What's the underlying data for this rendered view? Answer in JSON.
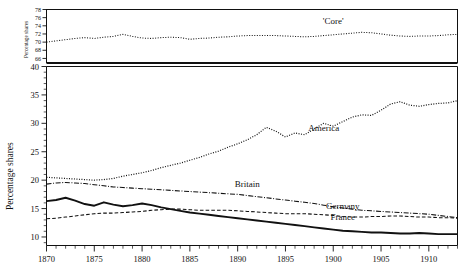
{
  "chart_data": {
    "type": "line",
    "title": "",
    "xlabel": "",
    "ylabel": "Percentage shares",
    "ylabel_top": "Percentage shares",
    "xlim": [
      1870,
      1913
    ],
    "ylim": [
      8.5,
      40
    ],
    "ylim_top": [
      65,
      78
    ],
    "grid": false,
    "legend": "inline-annotations",
    "yticks": [
      10,
      15,
      20,
      25,
      30,
      35,
      40
    ],
    "yticks_top": [
      66,
      68,
      70,
      72,
      74,
      76,
      78
    ],
    "xticks": [
      1870,
      1875,
      1880,
      1885,
      1890,
      1895,
      1900,
      1905,
      1910
    ],
    "xtick_labels": [
      "1870",
      "1875",
      "1880",
      "1885",
      "1890",
      "1895",
      "1900",
      "1905",
      "1910"
    ],
    "minor_xtick_step": 1,
    "x": [
      1870,
      1871,
      1872,
      1873,
      1874,
      1875,
      1876,
      1877,
      1878,
      1879,
      1880,
      1881,
      1882,
      1883,
      1884,
      1885,
      1886,
      1887,
      1888,
      1889,
      1890,
      1891,
      1892,
      1893,
      1894,
      1895,
      1896,
      1897,
      1898,
      1899,
      1900,
      1901,
      1902,
      1903,
      1904,
      1905,
      1906,
      1907,
      1908,
      1909,
      1910,
      1911,
      1912,
      1913
    ],
    "series": [
      {
        "name": "'Core'",
        "panel": "top",
        "style": "dotted",
        "label": "'Core'",
        "label_x": 1900,
        "label_y": 74.4,
        "values": [
          70.0,
          70.3,
          70.6,
          70.9,
          71.1,
          70.9,
          71.2,
          71.4,
          71.9,
          71.4,
          71.0,
          70.9,
          71.1,
          71.2,
          71.1,
          70.7,
          70.9,
          71.0,
          71.2,
          71.3,
          71.5,
          71.6,
          71.6,
          71.6,
          71.6,
          71.5,
          71.4,
          71.3,
          71.4,
          71.6,
          71.8,
          72.0,
          72.2,
          72.4,
          72.3,
          72.0,
          71.7,
          71.5,
          71.4,
          71.5,
          71.5,
          71.6,
          71.8,
          71.9
        ]
      },
      {
        "name": "America",
        "panel": "main",
        "style": "dotted",
        "label": "America",
        "label_x": 1899,
        "label_y": 28.7,
        "values": [
          20.5,
          20.4,
          20.3,
          20.2,
          20.1,
          20.0,
          20.1,
          20.3,
          20.7,
          21.0,
          21.3,
          21.7,
          22.2,
          22.6,
          23.0,
          23.5,
          24.0,
          24.6,
          25.1,
          25.8,
          26.4,
          27.1,
          28.0,
          29.3,
          28.6,
          27.6,
          28.3,
          28.0,
          29.0,
          30.0,
          29.5,
          30.3,
          31.1,
          31.5,
          31.4,
          32.3,
          33.4,
          33.8,
          33.2,
          33.0,
          33.3,
          33.5,
          33.6,
          34.0
        ]
      },
      {
        "name": "Britain",
        "panel": "main",
        "style": "dash-dot",
        "label": "Britain",
        "label_x": 1891,
        "label_y": 18.8,
        "values": [
          19.3,
          19.5,
          19.6,
          19.5,
          19.4,
          19.2,
          19.0,
          18.8,
          18.7,
          18.6,
          18.5,
          18.4,
          18.3,
          18.2,
          18.1,
          18.0,
          17.9,
          17.8,
          17.7,
          17.6,
          17.5,
          17.3,
          17.1,
          16.9,
          16.7,
          16.5,
          16.3,
          16.1,
          15.9,
          15.6,
          15.3,
          15.1,
          14.9,
          14.7,
          14.6,
          14.5,
          14.4,
          14.3,
          14.2,
          14.1,
          14.0,
          13.8,
          13.6,
          13.4
        ]
      },
      {
        "name": "Germany",
        "panel": "main",
        "style": "dashed",
        "label": "Germany",
        "label_x": 1901,
        "label_y": 14.9,
        "values": [
          13.2,
          13.3,
          13.5,
          13.7,
          13.9,
          14.1,
          14.2,
          14.2,
          14.3,
          14.4,
          14.5,
          14.7,
          14.8,
          14.9,
          14.9,
          14.8,
          14.7,
          14.7,
          14.7,
          14.7,
          14.6,
          14.5,
          14.4,
          14.3,
          14.2,
          14.1,
          14.1,
          14.1,
          14.0,
          13.9,
          13.8,
          13.6,
          13.5,
          13.5,
          13.6,
          13.6,
          13.7,
          13.7,
          13.6,
          13.5,
          13.5,
          13.4,
          13.4,
          13.3
        ]
      },
      {
        "name": "France",
        "panel": "main",
        "style": "solid",
        "label": "France",
        "label_x": 1901,
        "label_y": 13.0,
        "values": [
          16.3,
          16.5,
          16.9,
          16.4,
          15.8,
          15.5,
          16.1,
          15.7,
          15.4,
          15.6,
          15.9,
          15.6,
          15.2,
          14.9,
          14.6,
          14.3,
          14.1,
          13.9,
          13.7,
          13.5,
          13.3,
          13.1,
          12.9,
          12.7,
          12.5,
          12.3,
          12.1,
          11.9,
          11.7,
          11.5,
          11.3,
          11.1,
          11.0,
          10.9,
          10.8,
          10.8,
          10.7,
          10.6,
          10.6,
          10.7,
          10.6,
          10.5,
          10.5,
          10.5
        ]
      }
    ]
  },
  "axes": {
    "main_y_title": "Percentage shares",
    "top_y_title": "Percentage shares"
  },
  "colors": {
    "ink": "#111111",
    "background": "#ffffff"
  }
}
